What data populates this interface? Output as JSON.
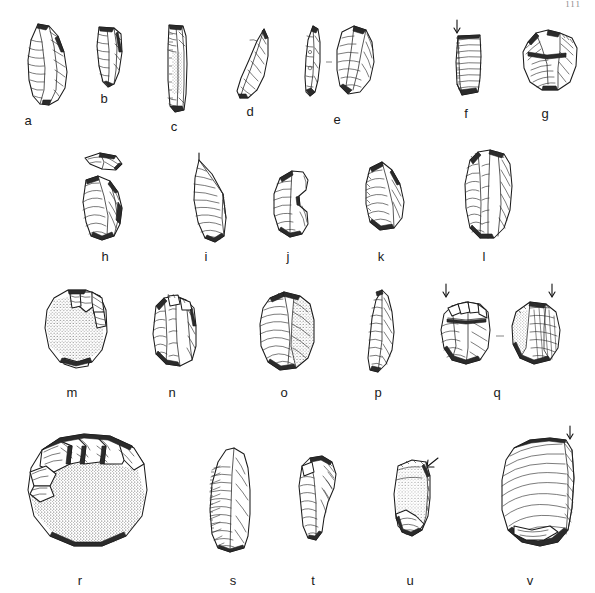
{
  "page": {
    "number": "111",
    "background_color": "#ffffff",
    "ink_color": "#1b1b1b",
    "width": 595,
    "height": 593
  },
  "figure": {
    "type": "archaeological-illustration-plate",
    "item_count": 22,
    "rows": [
      {
        "row_index": 1,
        "items": [
          {
            "label": "a",
            "kind": "retouched-blade",
            "views": 1,
            "arrow": false,
            "stipple": false,
            "cx": 45,
            "cy": 64,
            "w": 44,
            "h": 86,
            "caption_x": 28,
            "caption_y": 113
          },
          {
            "label": "b",
            "kind": "backed-bladelet",
            "views": 1,
            "arrow": false,
            "stipple": false,
            "cx": 106,
            "cy": 57,
            "w": 30,
            "h": 64,
            "caption_x": 104,
            "caption_y": 91
          },
          {
            "label": "c",
            "kind": "elongated-blade",
            "views": 1,
            "arrow": false,
            "stipple": true,
            "cx": 175,
            "cy": 62,
            "w": 26,
            "h": 84,
            "caption_x": 174,
            "caption_y": 119
          },
          {
            "label": "d",
            "kind": "pointed-flake",
            "views": 1,
            "arrow": false,
            "stipple": false,
            "cx": 250,
            "cy": 60,
            "w": 36,
            "h": 72,
            "caption_x": 250,
            "caption_y": 104
          },
          {
            "label": "e",
            "kind": "flake-two-views",
            "views": 2,
            "arrow": false,
            "stipple": false,
            "cx": 335,
            "cy": 62,
            "w": 80,
            "h": 80,
            "caption_x": 337,
            "caption_y": 112
          },
          {
            "label": "f",
            "kind": "blade-segment",
            "views": 1,
            "arrow": true,
            "stipple": false,
            "cx": 465,
            "cy": 62,
            "w": 40,
            "h": 76,
            "caption_x": 466,
            "caption_y": 106
          },
          {
            "label": "g",
            "kind": "core-fragment",
            "views": 1,
            "arrow": false,
            "stipple": false,
            "cx": 545,
            "cy": 60,
            "w": 62,
            "h": 64,
            "caption_x": 545,
            "caption_y": 106
          }
        ]
      },
      {
        "row_index": 2,
        "items": [
          {
            "label": "h",
            "kind": "flake-with-detached-fragment",
            "views": 2,
            "arrow": false,
            "stipple": false,
            "cx": 105,
            "cy": 196,
            "w": 56,
            "h": 96,
            "caption_x": 105,
            "caption_y": 249
          },
          {
            "label": "i",
            "kind": "triangular-flake",
            "views": 1,
            "arrow": true,
            "stipple": false,
            "cx": 205,
            "cy": 196,
            "w": 44,
            "h": 84,
            "caption_x": 206,
            "caption_y": 249
          },
          {
            "label": "j",
            "kind": "notched-flake",
            "views": 1,
            "arrow": false,
            "stipple": false,
            "cx": 287,
            "cy": 198,
            "w": 44,
            "h": 66,
            "caption_x": 288,
            "caption_y": 249
          },
          {
            "label": "k",
            "kind": "steep-scraper",
            "views": 1,
            "arrow": false,
            "stipple": false,
            "cx": 378,
            "cy": 196,
            "w": 46,
            "h": 70,
            "caption_x": 381,
            "caption_y": 249
          },
          {
            "label": "l",
            "kind": "blade-core",
            "views": 1,
            "arrow": false,
            "stipple": false,
            "cx": 484,
            "cy": 194,
            "w": 58,
            "h": 94,
            "caption_x": 484,
            "caption_y": 249
          }
        ]
      },
      {
        "row_index": 3,
        "items": [
          {
            "label": "m",
            "kind": "cortical-flake",
            "views": 1,
            "arrow": false,
            "stipple": true,
            "cx": 73,
            "cy": 328,
            "w": 76,
            "h": 82,
            "caption_x": 72,
            "caption_y": 385
          },
          {
            "label": "n",
            "kind": "dihedral-flake",
            "views": 1,
            "arrow": false,
            "stipple": false,
            "cx": 172,
            "cy": 330,
            "w": 56,
            "h": 76,
            "caption_x": 172,
            "caption_y": 385
          },
          {
            "label": "o",
            "kind": "cortex-backed-flake",
            "views": 1,
            "arrow": false,
            "stipple": true,
            "cx": 285,
            "cy": 330,
            "w": 72,
            "h": 80,
            "caption_x": 284,
            "caption_y": 385
          },
          {
            "label": "p",
            "kind": "pointed-blade",
            "views": 1,
            "arrow": false,
            "stipple": false,
            "cx": 378,
            "cy": 328,
            "w": 42,
            "h": 82,
            "caption_x": 378,
            "caption_y": 385
          },
          {
            "label": "q",
            "kind": "core-two-views",
            "views": 2,
            "arrow": true,
            "stipple": true,
            "cx": 497,
            "cy": 330,
            "w": 130,
            "h": 84,
            "caption_x": 497,
            "caption_y": 385
          }
        ]
      },
      {
        "row_index": 4,
        "items": [
          {
            "label": "r",
            "kind": "cortical-core-large",
            "views": 1,
            "arrow": false,
            "stipple": true,
            "cx": 83,
            "cy": 490,
            "w": 136,
            "h": 122,
            "caption_x": 80,
            "caption_y": 573
          },
          {
            "label": "s",
            "kind": "retouched-blade-large",
            "views": 1,
            "arrow": false,
            "stipple": false,
            "cx": 235,
            "cy": 500,
            "w": 62,
            "h": 106,
            "caption_x": 233,
            "caption_y": 573
          },
          {
            "label": "t",
            "kind": "curved-flake",
            "views": 1,
            "arrow": false,
            "stipple": false,
            "cx": 313,
            "cy": 498,
            "w": 50,
            "h": 82,
            "caption_x": 313,
            "caption_y": 573
          },
          {
            "label": "u",
            "kind": "cortical-flake-arrow",
            "views": 1,
            "arrow": true,
            "stipple": true,
            "cx": 412,
            "cy": 498,
            "w": 56,
            "h": 82,
            "caption_x": 410,
            "caption_y": 573
          },
          {
            "label": "v",
            "kind": "large-flake-arrow",
            "views": 1,
            "arrow": true,
            "stipple": false,
            "cx": 533,
            "cy": 492,
            "w": 82,
            "h": 124,
            "caption_x": 530,
            "caption_y": 573
          }
        ]
      }
    ]
  }
}
